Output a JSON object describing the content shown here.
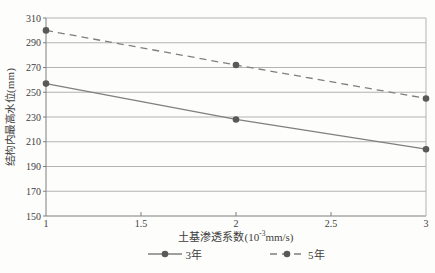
{
  "chart_data": {
    "type": "line",
    "x": [
      1,
      2,
      3
    ],
    "series": [
      {
        "name": "3年",
        "style": "solid",
        "values": [
          257,
          228,
          204
        ]
      },
      {
        "name": "5年",
        "style": "dashed",
        "values": [
          300,
          272,
          245
        ]
      }
    ],
    "title": "",
    "xlabel": "土基渗透系数(10⁻³mm/s)",
    "xlabel_parts": {
      "prefix": "土基渗透系数(10",
      "sup": "-3",
      "suffix": "mm/s)"
    },
    "ylabel": "结构内最高水位(mm)",
    "xlim": [
      1,
      3
    ],
    "ylim": [
      150,
      310
    ],
    "xticks": [
      1,
      1.5,
      2,
      2.5,
      3
    ],
    "xtick_labels": [
      "1",
      "1.5",
      "2",
      "2.5",
      "3"
    ],
    "yticks": [
      150,
      170,
      190,
      210,
      230,
      250,
      270,
      290,
      310
    ],
    "grid": "horizontal",
    "legend_position": "bottom",
    "colors": {
      "line": "#7f7f7f",
      "marker": "#595959",
      "grid": "#b3b3b3",
      "axis": "#7f7f7f",
      "text": "#3d3d3d"
    }
  },
  "legend": {
    "items": [
      {
        "label": "3年"
      },
      {
        "label": "5年"
      }
    ]
  }
}
